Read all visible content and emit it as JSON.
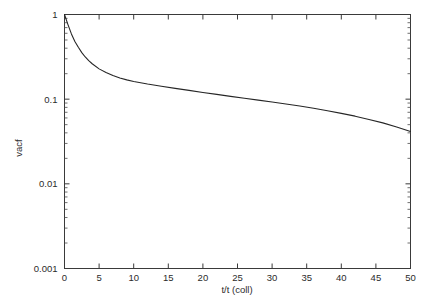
{
  "chart_data": {
    "type": "line",
    "title": "",
    "subtitle": "",
    "xlabel": "t/t (coll)",
    "ylabel": "vacf",
    "xscale": "linear",
    "yscale": "log",
    "xlim": [
      0,
      50
    ],
    "ylim": [
      0.001,
      1
    ],
    "grid": false,
    "legend": null,
    "legend_position": "none",
    "xticks": [
      0,
      5,
      10,
      15,
      20,
      25,
      30,
      35,
      40,
      45,
      50
    ],
    "xticklabels": [
      "0",
      "5",
      "10",
      "15",
      "20",
      "25",
      "30",
      "35",
      "40",
      "45",
      "50"
    ],
    "yticks": [
      0.001,
      0.01,
      0.1,
      1
    ],
    "yticklabels": [
      "0.001",
      "0.01",
      "0.1",
      "1"
    ],
    "yminorticks": [
      0.002,
      0.003,
      0.004,
      0.005,
      0.006,
      0.007,
      0.008,
      0.009,
      0.02,
      0.03,
      0.04,
      0.05,
      0.06,
      0.07,
      0.08,
      0.09,
      0.2,
      0.3,
      0.4,
      0.5,
      0.6,
      0.7,
      0.8,
      0.9
    ],
    "series": [
      {
        "name": "vacf",
        "color": "#262626",
        "x": [
          0,
          0.5,
          1,
          1.5,
          2,
          2.5,
          3,
          3.5,
          4,
          5,
          6,
          7,
          8,
          9,
          10,
          12,
          14,
          16,
          18,
          20,
          22,
          24,
          26,
          28,
          30,
          32,
          34,
          36,
          38,
          40,
          42,
          44,
          46,
          48,
          50
        ],
        "y": [
          1.0,
          0.76,
          0.59,
          0.48,
          0.41,
          0.355,
          0.315,
          0.285,
          0.262,
          0.228,
          0.206,
          0.19,
          0.178,
          0.169,
          0.162,
          0.151,
          0.142,
          0.134,
          0.127,
          0.12,
          0.114,
          0.108,
          0.1025,
          0.0975,
          0.0925,
          0.0875,
          0.083,
          0.078,
          0.073,
          0.068,
          0.063,
          0.0575,
          0.0525,
          0.047,
          0.0415
        ]
      }
    ]
  },
  "axes": {
    "x_title": "t/t (coll)",
    "y_title": "vacf"
  }
}
